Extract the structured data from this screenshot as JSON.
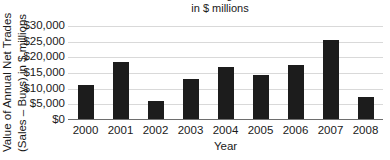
{
  "chart_data": {
    "type": "bar",
    "title": "2000 through 2008",
    "subtitle": "in $ millions",
    "xlabel": "Year",
    "ylabel_line1": "Value of Annual Net Trades",
    "ylabel_line2": "(Sales – Buys) in $ millions",
    "categories": [
      "2000",
      "2001",
      "2002",
      "2003",
      "2004",
      "2005",
      "2006",
      "2007",
      "2008"
    ],
    "values": [
      11000,
      18300,
      5900,
      12900,
      16700,
      14200,
      17100,
      25300,
      6900
    ],
    "ytick_labels": [
      "$30,000",
      "$25,000",
      "$20,000",
      "$15,000",
      "$10,000",
      "$5,000",
      "$0"
    ],
    "ytick_values": [
      30000,
      25000,
      20000,
      15000,
      10000,
      5000,
      0
    ],
    "ylim": [
      0,
      30000
    ],
    "grid": true,
    "legend": "none",
    "bar_color": "#1c1c1c",
    "grid_color": "#d9d9d9",
    "axis_color": "#6e6e6e"
  }
}
